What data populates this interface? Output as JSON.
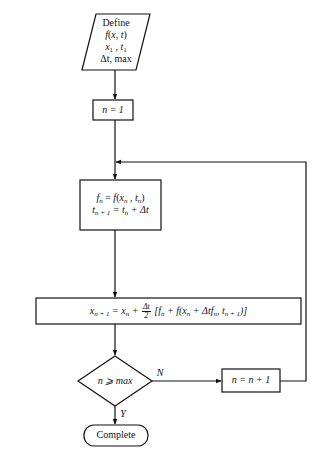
{
  "diagram": {
    "type": "flowchart",
    "nodes": [
      {
        "id": "input",
        "shape": "parallelogram",
        "lines": [
          "Define",
          "f(x, t)",
          "x1, t1",
          "Δt, max"
        ]
      },
      {
        "id": "init",
        "shape": "rectangle",
        "text": "n = 1"
      },
      {
        "id": "eval",
        "shape": "rectangle",
        "lines": [
          "fn = f(xn, tn)",
          "tn+1 = tn + Δt"
        ]
      },
      {
        "id": "update",
        "shape": "rectangle",
        "text": "xn+1 = xn + (Δt/2) [fn + f(xn + Δt fn, tn+1)]"
      },
      {
        "id": "decision",
        "shape": "diamond",
        "text": "n ⩾ max"
      },
      {
        "id": "increment",
        "shape": "rectangle",
        "text": "n = n + 1"
      },
      {
        "id": "end",
        "shape": "terminal",
        "text": "Complete"
      }
    ],
    "edges": [
      {
        "from": "input",
        "to": "init",
        "label": ""
      },
      {
        "from": "init",
        "to": "eval",
        "label": ""
      },
      {
        "from": "eval",
        "to": "update",
        "label": ""
      },
      {
        "from": "update",
        "to": "decision",
        "label": ""
      },
      {
        "from": "decision",
        "to": "increment",
        "label": "N"
      },
      {
        "from": "increment",
        "to": "eval",
        "label": ""
      },
      {
        "from": "decision",
        "to": "end",
        "label": "Y"
      }
    ]
  },
  "input": {
    "line1": "Define",
    "f": "f",
    "x": "x",
    "t": "t",
    "x1": "x",
    "x1_sub": "1",
    "t1": "t",
    "t1_sub": "1",
    "dt": "Δt, max"
  },
  "init": {
    "text": "n = 1"
  },
  "eval": {
    "line1_f": "f",
    "line1_sub": "n",
    "line1_eq": " = ",
    "line1_rhs": "f",
    "line2_t": "t",
    "line2_sub": "n + 1",
    "line2_rest": " = t",
    "line2_sub2": "n",
    "line2_plus": " + Δt"
  },
  "update": {
    "lhs": "x",
    "lhs_sub": "n + 1",
    "eq": " = x",
    "eq_sub": "n",
    "plus": " + ",
    "frac_num": "Δt",
    "frac_den": "2",
    "bracket": " [f",
    "b_sub": "n",
    "rest1": " + f(x",
    "rest1_sub": "n",
    "rest2": " + Δtf",
    "rest2_sub": "n",
    "rest3": ", t",
    "rest3_sub": "n + 1",
    "rest4": ")]"
  },
  "decision": {
    "text": "n ⩾ max",
    "yes_label": "Y",
    "no_label": "N"
  },
  "increment": {
    "text": "n = n + 1"
  },
  "end": {
    "text": "Complete"
  }
}
